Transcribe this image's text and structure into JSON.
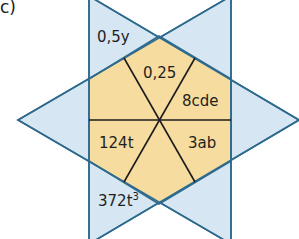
{
  "task_label": "c)",
  "colors": {
    "triangle_fill": "#cfe2f1",
    "hexagon_fill": "#f6dc9e",
    "outline": "#2e6a8e",
    "spoke": "#1c1c1c"
  },
  "star": {
    "points_label": {
      "top": "0,5y",
      "bottom_base": "372t",
      "bottom_exp": "3"
    }
  },
  "hexagon": {
    "sectors": {
      "top": "0,25",
      "upper_right": "8cde",
      "lower_right": "3ab",
      "left": "124t"
    }
  }
}
